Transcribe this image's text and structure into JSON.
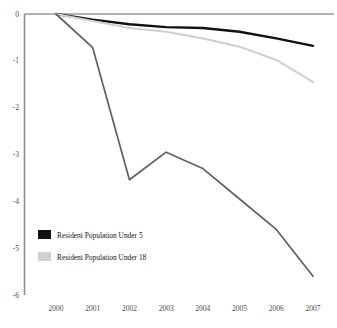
{
  "chart_data": {
    "type": "line",
    "title": "",
    "xlabel": "",
    "ylabel": "",
    "x": [
      2000,
      2001,
      2002,
      2003,
      2004,
      2005,
      2006,
      2007
    ],
    "categories": [
      "2000",
      "2001",
      "2002",
      "2003",
      "2004",
      "2005",
      "2006",
      "2007"
    ],
    "xlim": [
      2000,
      2007
    ],
    "ylim": [
      -6,
      0
    ],
    "yticks": [
      "0",
      "-1",
      "-2",
      "-3",
      "-4",
      "-5",
      "-6"
    ],
    "ytick_values": [
      0,
      -1,
      -2,
      -3,
      -4,
      -5,
      -6
    ],
    "grid": false,
    "legend_position": "lower-left",
    "series": [
      {
        "name": "Resident Population Under 5",
        "color": "#111111",
        "values": [
          0.0,
          -0.12,
          -0.22,
          -0.28,
          -0.3,
          -0.38,
          -0.52,
          -0.68
        ]
      },
      {
        "name": "Resident Population Under 18",
        "color": "#d0d0d0",
        "values": [
          0.0,
          -0.15,
          -0.3,
          -0.38,
          -0.52,
          -0.7,
          -0.98,
          -1.45
        ]
      },
      {
        "name": "",
        "color": "#606060",
        "values": [
          0.0,
          -0.72,
          -3.54,
          -2.95,
          -3.3,
          -3.95,
          -4.6,
          -5.6
        ]
      }
    ]
  },
  "axis": {
    "zero_line_color": "#9a9a9a",
    "axis_color": "#8f8f8f"
  },
  "legend": {
    "items": [
      {
        "label": "Resident Population Under 5",
        "color": "#111111"
      },
      {
        "label": "Resident Population Under 18",
        "color": "#d0d0d0"
      }
    ]
  }
}
